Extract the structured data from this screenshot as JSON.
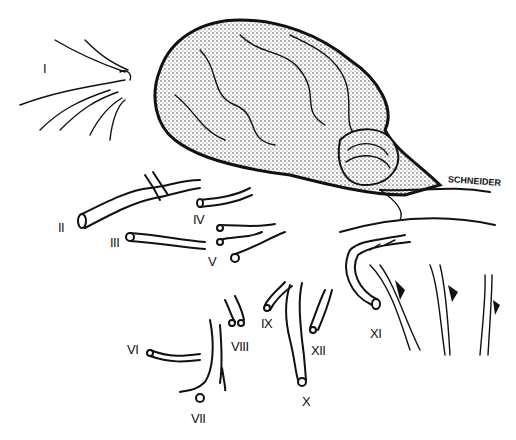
{
  "figure": {
    "signature": "SCHNEIDER",
    "labels": [
      {
        "id": "I",
        "text": "I",
        "x": 43,
        "y": 62
      },
      {
        "id": "II",
        "text": "II",
        "x": 58,
        "y": 221
      },
      {
        "id": "III",
        "text": "III",
        "x": 110,
        "y": 236
      },
      {
        "id": "IV",
        "text": "IV",
        "x": 193,
        "y": 213
      },
      {
        "id": "V",
        "text": "V",
        "x": 208,
        "y": 255
      },
      {
        "id": "VI",
        "text": "VI",
        "x": 127,
        "y": 343
      },
      {
        "id": "VII",
        "text": "VII",
        "x": 191,
        "y": 412
      },
      {
        "id": "VIII",
        "text": "VIII",
        "x": 231,
        "y": 340
      },
      {
        "id": "IX",
        "text": "IX",
        "x": 261,
        "y": 317
      },
      {
        "id": "X",
        "text": "X",
        "x": 302,
        "y": 395
      },
      {
        "id": "XI",
        "text": "XI",
        "x": 370,
        "y": 327
      },
      {
        "id": "XII",
        "text": "XII",
        "x": 311,
        "y": 344
      }
    ],
    "colors": {
      "ink": "#111111",
      "paper": "#ffffff"
    }
  }
}
